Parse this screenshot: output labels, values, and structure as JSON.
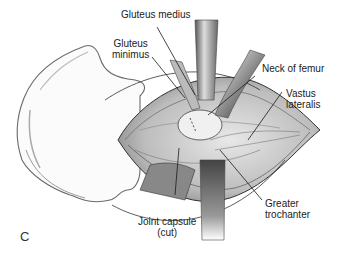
{
  "figure": {
    "panel_letter": "C",
    "labels": {
      "gluteus_medius": "Gluteus medius",
      "gluteus_minimus_line1": "Gluteus",
      "gluteus_minimus_line2": "minimus",
      "neck_of_femur": "Neck of femur",
      "vastus_lateralis_line1": "Vastus",
      "vastus_lateralis_line2": "lateralis",
      "joint_capsule_line1": "Joint capsule",
      "joint_capsule_line2": "(cut)",
      "greater_trochanter_line1": "Greater",
      "greater_trochanter_line2": "trochanter"
    },
    "colors": {
      "background": "#ffffff",
      "line": "#1a1a1a",
      "text": "#222222"
    }
  }
}
